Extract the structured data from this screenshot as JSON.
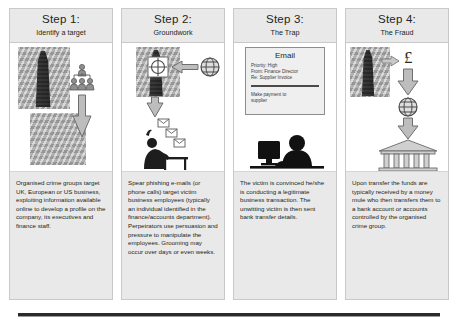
{
  "infographic": {
    "title": "Business email compromise fraud — four step process",
    "accent": "#e9e9e9",
    "border_color": "#c9c9c9",
    "text_color": "#231f20"
  },
  "steps": [
    {
      "step_label": "Step 1:",
      "subtitle": "Identify a target",
      "body": "Organised crime groups target UK, European or US business, exploiting information available online to develop a profile on the company, its executives and finance staff.",
      "icons": [
        "office-tower-icon",
        "org-chart-people-icon",
        "up-arrow-icon",
        "website-screenshot-icon"
      ]
    },
    {
      "step_label": "Step 2:",
      "subtitle": "Groundwork",
      "body": "Spear phishing e-mails (or phone calls) target victim business employees (typically an individual identified in the finance/accounts department). Perpetrators use persuasion and pressure to manipulate the employees. Grooming may occur over days or even weeks.",
      "icons": [
        "office-tower-icon",
        "crosshair-target-icon",
        "left-arrow-icon",
        "globe-icon",
        "down-arrow-icon",
        "envelope-icon",
        "person-at-desk-icon"
      ]
    },
    {
      "step_label": "Step 3:",
      "subtitle": "The Trap",
      "body": "The victim is convinced he/she is conducting a legitimate business transaction. The unwitting victim is then sent bank transfer details.",
      "icons": [
        "email-card-icon",
        "person-at-computer-icon"
      ],
      "email": {
        "heading": "Email",
        "priority": "Priority: High",
        "from": "From: Finance Director",
        "subject": "Re: Supplier Invoice",
        "message_line_1": "Make payment to",
        "message_line_2": "supplier"
      }
    },
    {
      "step_label": "Step 4:",
      "subtitle": "The Fraud",
      "body": "Upon transfer the funds are typically received by a money mule who then transfers them to a bank account or accounts controlled by the organised crime group.",
      "icons": [
        "office-tower-icon",
        "right-arrow-icon",
        "pound-sign-icon",
        "down-arrow-icon",
        "globe-icon",
        "bank-building-icon"
      ],
      "currency_symbol": "£"
    }
  ]
}
